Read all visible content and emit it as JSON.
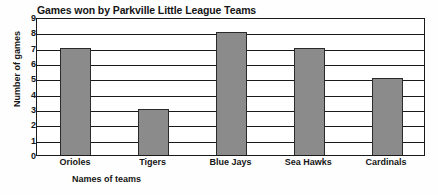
{
  "chart_data": {
    "type": "bar",
    "title": "Games won by Parkville Little League Teams",
    "xlabel": "Names of teams",
    "ylabel": "Number of games",
    "categories": [
      "Orioles",
      "Tigers",
      "Blue Jays",
      "Sea Hawks",
      "Cardinals"
    ],
    "values": [
      7,
      3,
      8,
      7,
      5
    ],
    "ylim": [
      0,
      9
    ],
    "ytick_labels": [
      "0",
      "1",
      "2",
      "3",
      "4",
      "5",
      "6",
      "7",
      "8",
      "9"
    ],
    "ytick_values": [
      0,
      1,
      2,
      3,
      4,
      5,
      6,
      7,
      8,
      9
    ],
    "grid": true,
    "grid_axis": "y",
    "legend": false,
    "bar_color": "#8b8b8b",
    "bar_edge_color": "#2a2a2a",
    "axis_color": "#1a1a1a",
    "background_color": "#ffffff"
  }
}
